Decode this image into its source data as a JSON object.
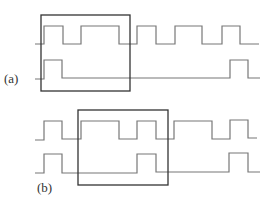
{
  "figure": {
    "panels": [
      {
        "label": "(a)",
        "label_pos": {
          "x": 4,
          "y": 72
        },
        "box": {
          "x": 41,
          "y": 15,
          "w": 89,
          "h": 76
        },
        "waveforms": [
          {
            "name": "signal-top",
            "points": "35,44 41,44 41,44 44,44 44,26 63,26 63,44 81,44 81,26 119,26 119,44 137,44 137,26 156,26 156,44 175,44 175,26 202,26 202,44 222,44 222,26 240,26 240,44 259,44",
            "stub": "44,36 44,26"
          },
          {
            "name": "signal-bottom",
            "points": "35,79 44,79 44,60 62,60 62,78 230,78 230,60 248,60 248,78 260,78",
            "stub": "44,70 44,60"
          }
        ]
      },
      {
        "label": "(b)",
        "label_pos": {
          "x": 37,
          "y": 181
        },
        "box": {
          "x": 78,
          "y": 110,
          "w": 90,
          "h": 75
        },
        "waveforms": [
          {
            "name": "signal-top",
            "points": "35,140 44,140 44,121 62,121 62,139 78,139 78,139 81,139 81,121 119,121 119,139 137,139 137,121 156,121 156,139 174,139 174,121 212,121 212,139 230,139 230,120 248,120 248,138 257,138",
            "stub": "81,131 81,121"
          },
          {
            "name": "signal-bottom",
            "points": "35,173 44,173 44,154 62,154 62,173 78,173 82,173 137,173 137,154 156,154 156,172 229,172 229,153 248,153 248,172 260,172",
            "stub": ""
          }
        ]
      }
    ],
    "colors": {
      "wave": "#777777",
      "box": "#333333",
      "label": "#333333"
    }
  }
}
